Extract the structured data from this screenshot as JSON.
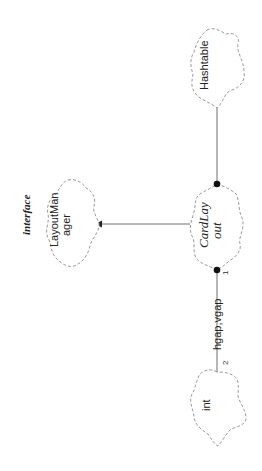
{
  "diagram": {
    "type": "UML class diagram (Booch cloud notation), rotated 90°",
    "classes": [
      {
        "id": "hashtable",
        "label": "Hashtable",
        "italic": false
      },
      {
        "id": "cardlayout",
        "label_line1": "CardLay",
        "label_line2": "out",
        "italic": true
      },
      {
        "id": "layoutmanager",
        "label_line1": "LayoutMan",
        "label_line2": "ager",
        "stereotype": "interface"
      },
      {
        "id": "int",
        "label": "int"
      }
    ],
    "relationships": [
      {
        "from": "cardlayout",
        "to": "hashtable",
        "kind": "has-a",
        "adornment": "filled-dot"
      },
      {
        "from": "cardlayout",
        "to": "layoutmanager",
        "kind": "implements",
        "adornment": "arrow"
      },
      {
        "from": "cardlayout",
        "to": "int",
        "kind": "has-a",
        "adornment": "filled-dot",
        "label": "hgap,vgap",
        "source_cardinality": "1",
        "target_cardinality": "2"
      }
    ]
  },
  "labels": {
    "hashtable": "Hashtable",
    "cardlayout_1": "CardLay",
    "cardlayout_2": "out",
    "layoutmanager_1": "LayoutMan",
    "layoutmanager_2": "ager",
    "interface_stereotype": "interface",
    "int": "int",
    "assoc_label": "hgap,vgap",
    "card_source": "1",
    "card_target": "2"
  }
}
